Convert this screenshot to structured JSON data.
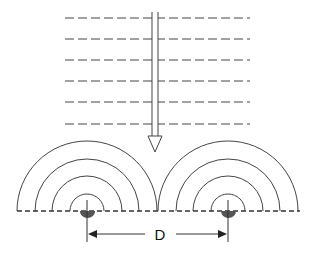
{
  "diagram": {
    "type": "wave-interference",
    "colors": {
      "line": "#444444",
      "source": "#555555",
      "background": "#ffffff"
    },
    "incident_wavefronts": {
      "style": "dashed",
      "count": 6,
      "y_positions": [
        18,
        39,
        60,
        81,
        102,
        124
      ],
      "x_start": 65,
      "x_end": 250
    },
    "incident_arrow": {
      "direction": "down",
      "x": 155,
      "y_start": 12,
      "y_end": 152
    },
    "barrier_line": {
      "style": "dashed",
      "y": 211,
      "x_start": 17,
      "x_end": 300
    },
    "sources": [
      {
        "name": "left-source",
        "cx": 87,
        "radii": [
          17,
          35,
          52,
          70
        ]
      },
      {
        "name": "right-source",
        "cx": 228,
        "radii": [
          17,
          35,
          52,
          70
        ]
      }
    ],
    "separation": {
      "label": "D",
      "y": 234,
      "x_start": 87,
      "x_end": 228
    }
  }
}
